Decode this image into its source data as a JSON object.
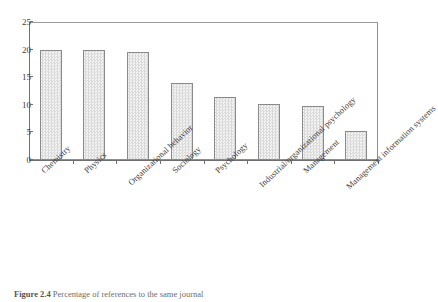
{
  "chart_data": {
    "type": "bar",
    "title": "",
    "xlabel": "",
    "ylabel": "",
    "ylim": [
      0,
      25
    ],
    "yticks": [
      0,
      5,
      10,
      15,
      20,
      25
    ],
    "grid": false,
    "legend": "none",
    "categories": [
      "Chemistry",
      "Physics",
      "Organizational behavior",
      "Sociology",
      "Psychology",
      "Industrial/organizational psychology",
      "Management",
      "Management information systems"
    ],
    "values": [
      20.0,
      20.0,
      19.5,
      14.0,
      11.5,
      10.2,
      9.8,
      5.2
    ]
  },
  "caption": {
    "number": "Figure 2.4",
    "text": "Percentage of references to the same journal"
  },
  "colors": {
    "bar_fill": "#ededed",
    "bar_hatch": "#d9d9d9",
    "bar_border": "#8a8a8a",
    "axis": "#6f6f6f",
    "frame": "#8e8e8e",
    "text": "#3d3d3d",
    "caption_text": "#6d6d6d"
  }
}
